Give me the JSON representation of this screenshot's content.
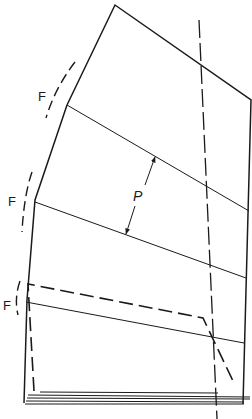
{
  "diagram": {
    "labels": {
      "fold_1": "F",
      "fold_2": "F",
      "fold_3": "F",
      "panel_spacing": "P"
    },
    "colors": {
      "line": "#1a1a1a",
      "background": "#ffffff"
    }
  }
}
